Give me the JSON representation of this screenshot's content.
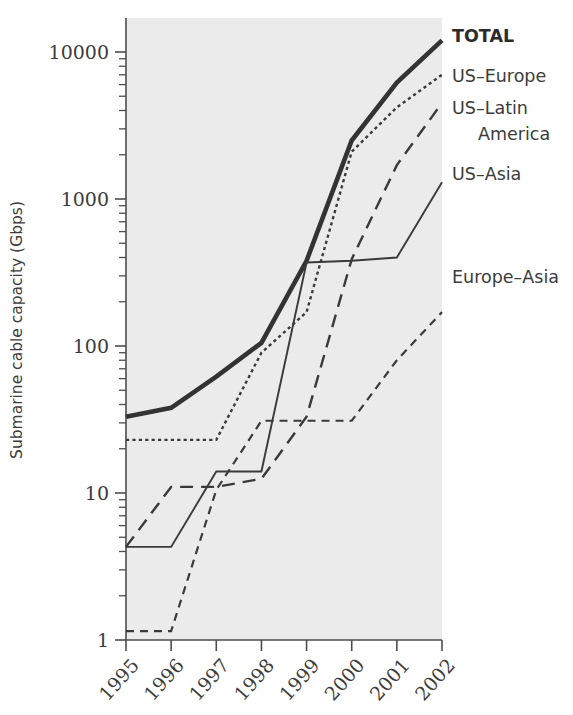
{
  "chart_data": {
    "type": "line",
    "title": "",
    "xlabel": "",
    "ylabel": "Submarine cable capacity (Gbps)",
    "yscale": "log",
    "ylim": [
      1,
      20000
    ],
    "grid": false,
    "legend_position": "right-inline",
    "categories": [
      "1995",
      "1996",
      "1997",
      "1998",
      "1999",
      "2000",
      "2001",
      "2002"
    ],
    "x_tick_labels": [
      "1995",
      "1996",
      "1997",
      "1998",
      "1999",
      "2000",
      "2001",
      "2002"
    ],
    "y_tick_labels": [
      "1",
      "10",
      "100",
      "1000",
      "10000"
    ],
    "y_tick_values": [
      1,
      10,
      100,
      1000,
      10000
    ],
    "series": [
      {
        "name": "TOTAL",
        "label": "TOTAL",
        "style": "solid-thick",
        "emphasis": "bold",
        "color": "#333333",
        "values": [
          33,
          38,
          62,
          105,
          380,
          2500,
          6200,
          12000
        ]
      },
      {
        "name": "US-Europe",
        "label": "US–Europe",
        "style": "dotted",
        "color": "#3a3a3a",
        "values": [
          23,
          23,
          23,
          90,
          170,
          2100,
          4200,
          7000
        ]
      },
      {
        "name": "US-Latin America",
        "label": "US–Latin\n   America",
        "label_line1": "US–Latin",
        "label_line2": "America",
        "style": "long-dash",
        "color": "#3a3a3a",
        "values": [
          4.3,
          11,
          11,
          12.5,
          33,
          390,
          1700,
          4500
        ]
      },
      {
        "name": "US-Asia",
        "label": "US–Asia",
        "style": "solid-thin",
        "color": "#3a3a3a",
        "values": [
          4.3,
          4.3,
          14,
          14,
          370,
          380,
          400,
          1300
        ]
      },
      {
        "name": "Europe-Asia",
        "label": "Europe–Asia",
        "style": "dash",
        "color": "#3a3a3a",
        "values": [
          1.15,
          1.15,
          10.5,
          31,
          31,
          31,
          80,
          170
        ]
      }
    ]
  },
  "axes": {
    "y_title": "Submarine cable capacity (Gbps)",
    "y_labels": [
      "10000",
      "1000",
      "100",
      "10",
      "1"
    ],
    "x_labels": [
      "1995",
      "1996",
      "1997",
      "1998",
      "1999",
      "2000",
      "2001",
      "2002"
    ]
  },
  "legend": {
    "items": [
      {
        "label": "TOTAL",
        "bold": true
      },
      {
        "label": "US–Europe",
        "bold": false
      },
      {
        "label": "US–Latin",
        "bold": false
      },
      {
        "label": "America",
        "bold": false
      },
      {
        "label": "US–Asia",
        "bold": false
      },
      {
        "label": "Europe–Asia",
        "bold": false
      }
    ]
  },
  "colors": {
    "plot_background": "#ebebeb",
    "page_background": "#ffffff",
    "ink": "#3a3a3a",
    "total_ink": "#333333"
  }
}
